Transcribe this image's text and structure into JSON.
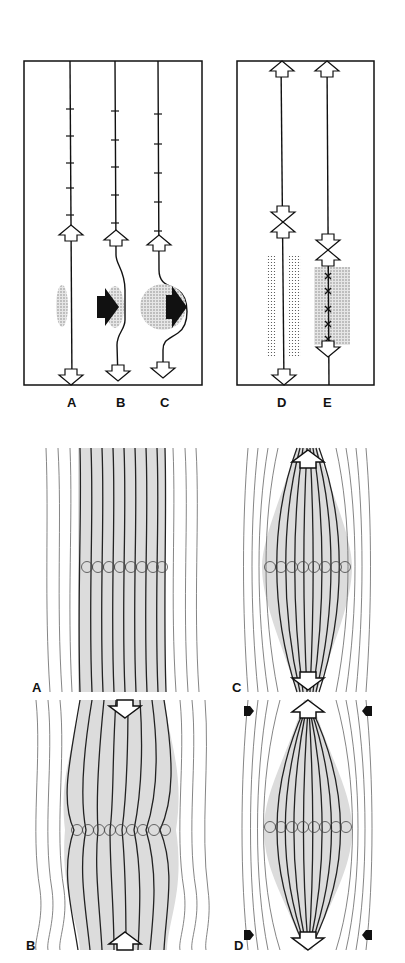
{
  "figure": {
    "top_left_panel": {
      "labels": [
        "A",
        "B",
        "C"
      ],
      "columns": [
        {
          "label": "A",
          "x": 70,
          "ticks": [
            109,
            136,
            163,
            188,
            215
          ],
          "up_arrow_y": 252,
          "down_arrow_y": 383,
          "blob": "small-oval",
          "push_arrow": false
        },
        {
          "label": "B",
          "x": 115,
          "ticks": [
            111,
            140,
            167,
            195,
            223
          ],
          "up_arrow_y": 257,
          "down_arrow_y": 380,
          "blob": "medium-oval",
          "push_arrow": true
        },
        {
          "label": "C",
          "x": 158,
          "ticks": [
            114,
            144,
            173,
            202,
            231
          ],
          "up_arrow_y": 262,
          "down_arrow_y": 378,
          "blob": "large-circle",
          "push_arrow": true
        }
      ]
    },
    "top_right_panel": {
      "labels": [
        "D",
        "E"
      ],
      "columns": [
        {
          "label": "D",
          "x": 282,
          "description": "opposed arrows at mid-height, dotted bands either side"
        },
        {
          "label": "E",
          "x": 327,
          "description": "opposed arrows, shaded band with x-marks along line"
        }
      ]
    },
    "bottom_panels": [
      {
        "label": "A",
        "description": "parallel fibres, uniform shaded band, row of circles"
      },
      {
        "label": "B",
        "description": "wavy fibres, band narrowed at circle row, arrows pointing inward"
      },
      {
        "label": "C",
        "description": "spindle-shaped shaded band, arrows pointing outward"
      },
      {
        "label": "D",
        "description": "spindle narrowed at ends, outward arrows, lateral black compressive arrows"
      }
    ]
  },
  "colors": {
    "ink": "#111111",
    "shade": "#d9d9d9",
    "stipple": "#9a9a9a",
    "thin_line": "#555555"
  }
}
